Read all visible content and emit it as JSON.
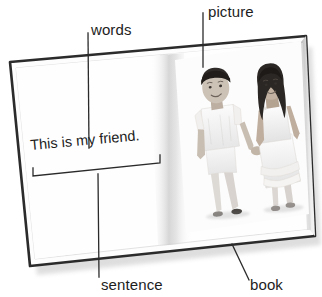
{
  "figure": {
    "type": "labeled-diagram",
    "background_color": "#ffffff",
    "label_color": "#1d1d1d"
  },
  "book": {
    "page_color": "#fdfdfd",
    "cover_color": "#2b2b2b",
    "gutter_shade": "#d8d8d8",
    "left_page": {
      "sentence": "This is my friend.",
      "sentence_bracket": true
    },
    "right_page": {
      "photo_alt": "photograph of a boy and a girl in white clothes holding hands",
      "photo_tone": "grayscale"
    }
  },
  "callouts": [
    {
      "id": "words",
      "label": "words",
      "leader": "vertical",
      "points_to": "sentence-words"
    },
    {
      "id": "picture",
      "label": "picture",
      "leader": "vertical",
      "points_to": "photo"
    },
    {
      "id": "sentence",
      "label": "sentence",
      "leader": "vertical",
      "points_to": "sentence-bracket"
    },
    {
      "id": "book",
      "label": "book",
      "leader": "diagonal",
      "points_to": "book-cover-edge"
    }
  ]
}
